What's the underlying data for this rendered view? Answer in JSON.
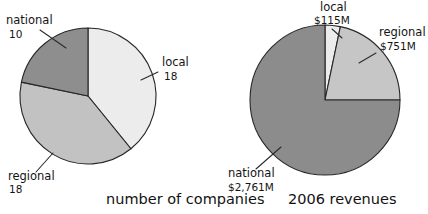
{
  "figure": {
    "background_color": "#ffffff",
    "outline_color": "#262626"
  },
  "charts": [
    {
      "id": "number-of-companies",
      "caption": "number of companies",
      "caption_x": 106,
      "caption_y": 204,
      "center": {
        "x": 88,
        "y": 96
      },
      "radius": 68,
      "slices": [
        {
          "key": "local",
          "label": "local",
          "value_text": "18",
          "value": 18,
          "color": "#ececec",
          "start_deg": 0,
          "sweep_deg": 140.87,
          "label_x": 162,
          "label_y": 66,
          "value_x": 164,
          "value_y": 80,
          "leader": {
            "x1": 158,
            "y1": 72,
            "x2": 141,
            "y2": 80
          }
        },
        {
          "key": "regional",
          "label": "regional",
          "value_text": "18",
          "value": 18,
          "color": "#c2c2c2",
          "start_deg": 140.87,
          "sweep_deg": 140.87,
          "label_x": 8,
          "label_y": 180,
          "value_x": 9,
          "value_y": 193,
          "leader": {
            "x1": 36,
            "y1": 172,
            "x2": 53,
            "y2": 153
          }
        },
        {
          "key": "national",
          "label": "national",
          "value_text": "10",
          "value": 10,
          "color": "#8e8e8e",
          "start_deg": 281.74,
          "sweep_deg": 78.26,
          "label_x": 6,
          "label_y": 24,
          "value_x": 9,
          "value_y": 38,
          "leader": {
            "x1": 40,
            "y1": 30,
            "x2": 66,
            "y2": 48
          }
        }
      ]
    },
    {
      "id": "2006-revenues",
      "caption": "2006 revenues",
      "caption_x": 288,
      "caption_y": 204,
      "center": {
        "x": 325,
        "y": 100
      },
      "radius": 75,
      "slices": [
        {
          "key": "local",
          "label": "local",
          "value_text": "$115M",
          "value": 115,
          "color": "#ececec",
          "start_deg": 0,
          "sweep_deg": 11.83,
          "label_x": 320,
          "label_y": 11,
          "value_x": 314,
          "value_y": 24,
          "leader": {
            "x1": 332,
            "y1": 29,
            "x2": 342,
            "y2": 38
          }
        },
        {
          "key": "regional",
          "label": "regional",
          "value_text": "$751M",
          "value": 751,
          "color": "#c6c6c6",
          "start_deg": 11.83,
          "sweep_deg": 78.17,
          "label_x": 379,
          "label_y": 36,
          "value_x": 380,
          "value_y": 50,
          "leader": {
            "x1": 376,
            "y1": 53,
            "x2": 359,
            "y2": 63
          }
        },
        {
          "key": "national",
          "label": "national",
          "value_text": "$2,761M",
          "value": 2761,
          "color": "#8c8c8c",
          "start_deg": 90,
          "sweep_deg": 270,
          "label_x": 228,
          "label_y": 177,
          "value_x": 228,
          "value_y": 191,
          "leader": {
            "x1": 256,
            "y1": 169,
            "x2": 281,
            "y2": 147
          }
        }
      ]
    }
  ],
  "chart_data": [
    {
      "type": "pie",
      "title": "number of companies",
      "categories": [
        "local",
        "regional",
        "national"
      ],
      "values": [
        18,
        18,
        10
      ],
      "value_labels": [
        "18",
        "18",
        "10"
      ],
      "colors": [
        "#ececec",
        "#c2c2c2",
        "#8e8e8e"
      ],
      "total": 46,
      "start_angle_deg": 90,
      "direction": "clockwise",
      "legend": "none",
      "labels_position": "outside-with-leader-lines",
      "xlabel": "",
      "ylabel": ""
    },
    {
      "type": "pie",
      "title": "2006 revenues",
      "categories": [
        "local",
        "regional",
        "national"
      ],
      "values": [
        115,
        751,
        2761
      ],
      "value_labels": [
        "$115M",
        "$751M",
        "$2,761M"
      ],
      "units": "millions of US dollars",
      "colors": [
        "#ececec",
        "#c6c6c6",
        "#8c8c8c"
      ],
      "total": 3627,
      "start_angle_deg": 90,
      "direction": "clockwise",
      "legend": "none",
      "labels_position": "outside-with-leader-lines",
      "xlabel": "",
      "ylabel": ""
    }
  ]
}
